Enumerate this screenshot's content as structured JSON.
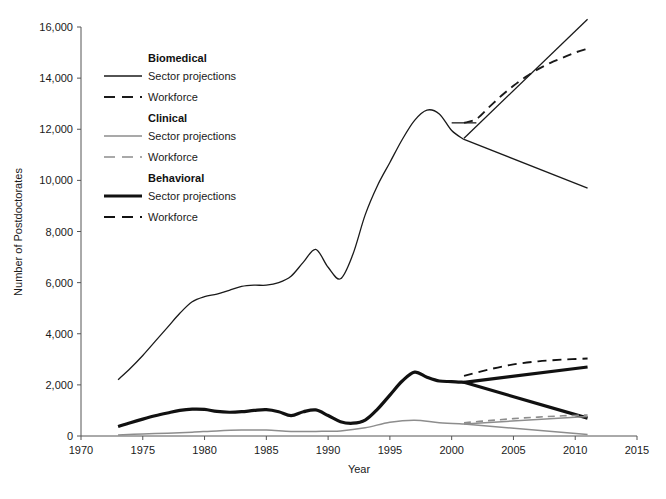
{
  "chart_data": {
    "type": "line",
    "title": "",
    "xlabel": "Year",
    "ylabel": "Number of Postdoctorates",
    "xlim": [
      1970,
      2015
    ],
    "ylim": [
      0,
      16000
    ],
    "xticks": [
      "1970",
      "1975",
      "1980",
      "1985",
      "1990",
      "1995",
      "2000",
      "2005",
      "2010",
      "2015"
    ],
    "yticks": [
      "0",
      "2,000",
      "4,000",
      "6,000",
      "8,000",
      "10,000",
      "12,000",
      "14,000",
      "16,000"
    ],
    "grid": false,
    "legend_position": "upper-left-inside",
    "legend_groups": [
      {
        "heading": "Biomedical",
        "items": [
          {
            "label": "Sector projections",
            "style": "solid",
            "color": "#1a1a1a",
            "width": 1.4
          },
          {
            "label": "Workforce",
            "style": "dashed",
            "color": "#1a1a1a",
            "width": 1.8
          }
        ]
      },
      {
        "heading": "Clinical",
        "items": [
          {
            "label": "Sector projections",
            "style": "solid",
            "color": "#8d8d8d",
            "width": 1.4
          },
          {
            "label": "Workforce",
            "style": "dashed",
            "color": "#8d8d8d",
            "width": 1.6
          }
        ]
      },
      {
        "heading": "Behavioral",
        "items": [
          {
            "label": "Sector projections",
            "style": "solid",
            "color": "#111111",
            "width": 3.2
          },
          {
            "label": "Workforce",
            "style": "dashed",
            "color": "#111111",
            "width": 1.8
          }
        ]
      }
    ],
    "series": [
      {
        "name": "Biomedical historical",
        "group": "Biomedical",
        "style": "solid",
        "color": "#1a1a1a",
        "width": 1.3,
        "x": [
          1973,
          1974,
          1975,
          1976,
          1977,
          1978,
          1979,
          1980,
          1981,
          1982,
          1983,
          1984,
          1985,
          1986,
          1987,
          1988,
          1989,
          1990,
          1991,
          1992,
          1993,
          1994,
          1995,
          1996,
          1997,
          1998,
          1999,
          2000,
          2001
        ],
        "y": [
          2200,
          2650,
          3150,
          3700,
          4250,
          4800,
          5250,
          5450,
          5550,
          5700,
          5850,
          5900,
          5900,
          6000,
          6250,
          6800,
          7300,
          6600,
          6150,
          7100,
          8650,
          9800,
          10700,
          11600,
          12350,
          12750,
          12600,
          11950,
          11600
        ]
      },
      {
        "name": "Biomedical projections upper",
        "group": "Biomedical",
        "style": "solid",
        "color": "#1a1a1a",
        "width": 1.3,
        "x": [
          2001,
          2011
        ],
        "y": [
          11650,
          16300
        ]
      },
      {
        "name": "Biomedical projections lower",
        "group": "Biomedical",
        "style": "solid",
        "color": "#1a1a1a",
        "width": 1.3,
        "x": [
          2001,
          2011
        ],
        "y": [
          11600,
          9700
        ]
      },
      {
        "name": "Biomedical projections flat stub",
        "group": "Biomedical",
        "style": "solid",
        "color": "#1a1a1a",
        "width": 1.3,
        "x": [
          2000,
          2002
        ],
        "y": [
          12250,
          12250
        ]
      },
      {
        "name": "Biomedical workforce",
        "group": "Biomedical",
        "style": "dashed",
        "color": "#1a1a1a",
        "width": 1.9,
        "x": [
          2001,
          2002,
          2003,
          2004,
          2005,
          2006,
          2007,
          2008,
          2009,
          2010,
          2011
        ],
        "y": [
          12250,
          12400,
          12850,
          13300,
          13700,
          14050,
          14350,
          14600,
          14800,
          15000,
          15150
        ]
      },
      {
        "name": "Behavioral historical",
        "group": "Behavioral",
        "style": "solid",
        "color": "#111111",
        "width": 3.2,
        "x": [
          1973,
          1974,
          1975,
          1976,
          1977,
          1978,
          1979,
          1980,
          1981,
          1982,
          1983,
          1984,
          1985,
          1986,
          1987,
          1988,
          1989,
          1990,
          1991,
          1992,
          1993,
          1994,
          1995,
          1996,
          1997,
          1998,
          1999,
          2000,
          2001
        ],
        "y": [
          370,
          520,
          660,
          790,
          900,
          1000,
          1050,
          1040,
          960,
          930,
          950,
          1000,
          1030,
          950,
          800,
          950,
          1020,
          800,
          560,
          500,
          620,
          1050,
          1600,
          2150,
          2500,
          2300,
          2150,
          2130,
          2100
        ]
      },
      {
        "name": "Behavioral projections upper",
        "group": "Behavioral",
        "style": "solid",
        "color": "#111111",
        "width": 3.2,
        "x": [
          2001,
          2011
        ],
        "y": [
          2100,
          2700
        ]
      },
      {
        "name": "Behavioral projections lower",
        "group": "Behavioral",
        "style": "solid",
        "color": "#111111",
        "width": 3.2,
        "x": [
          2001,
          2011
        ],
        "y": [
          2100,
          700
        ]
      },
      {
        "name": "Behavioral workforce",
        "group": "Behavioral",
        "style": "dashed",
        "color": "#111111",
        "width": 1.9,
        "x": [
          2001,
          2003,
          2005,
          2007,
          2009,
          2011
        ],
        "y": [
          2350,
          2600,
          2800,
          2920,
          2990,
          3030
        ]
      },
      {
        "name": "Clinical historical",
        "group": "Clinical",
        "style": "solid",
        "color": "#8d8d8d",
        "width": 1.5,
        "x": [
          1973,
          1975,
          1977,
          1979,
          1981,
          1983,
          1985,
          1987,
          1989,
          1991,
          1993,
          1995,
          1997,
          1999,
          2001
        ],
        "y": [
          40,
          80,
          110,
          150,
          200,
          230,
          230,
          180,
          180,
          200,
          320,
          540,
          620,
          520,
          470
        ]
      },
      {
        "name": "Clinical projections upper",
        "group": "Clinical",
        "style": "solid",
        "color": "#8d8d8d",
        "width": 1.5,
        "x": [
          2001,
          2011
        ],
        "y": [
          470,
          760
        ]
      },
      {
        "name": "Clinical projections lower",
        "group": "Clinical",
        "style": "solid",
        "color": "#8d8d8d",
        "width": 1.5,
        "x": [
          2001,
          2011
        ],
        "y": [
          470,
          60
        ]
      },
      {
        "name": "Clinical workforce",
        "group": "Clinical",
        "style": "dashed",
        "color": "#8d8d8d",
        "width": 1.6,
        "x": [
          2001,
          2003,
          2005,
          2007,
          2009,
          2011
        ],
        "y": [
          520,
          600,
          680,
          740,
          790,
          820
        ]
      }
    ]
  }
}
